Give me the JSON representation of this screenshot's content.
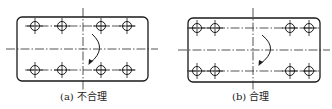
{
  "figures": [
    {
      "id": "a",
      "caption": "(a) 不合理",
      "caption_pos": {
        "x": 60,
        "y": 88
      },
      "rect": {
        "x": 17,
        "y": 17,
        "w": 131,
        "h": 64,
        "r": 5
      },
      "center": {
        "x": 83,
        "y": 49,
        "v_top": 8,
        "v_bottom": 90,
        "h_left": 6,
        "h_right": 158
      },
      "hole_rows_y": [
        26,
        70
      ],
      "hole_xs": [
        35,
        62,
        101,
        127
      ],
      "arc": {
        "x1": 92,
        "y1": 34,
        "x2": 92,
        "y2": 63,
        "bulge_x": 100
      },
      "verdict": "unreasonable"
    },
    {
      "id": "b",
      "caption": "(b) 合理",
      "caption_pos": {
        "x": 232,
        "y": 88
      },
      "rect": {
        "x": 188,
        "y": 18,
        "w": 132,
        "h": 64,
        "r": 5
      },
      "center": {
        "x": 253,
        "y": 50,
        "v_top": 8,
        "v_bottom": 90,
        "h_left": 178,
        "h_right": 330
      },
      "hole_rows_y": [
        28,
        71
      ],
      "hole_xs": [
        197,
        215,
        290,
        309
      ],
      "arc": {
        "x1": 262,
        "y1": 35,
        "x2": 262,
        "y2": 64,
        "bulge_x": 271
      },
      "verdict": "reasonable"
    }
  ],
  "hole_radius": 4.5,
  "cross_half": 8
}
